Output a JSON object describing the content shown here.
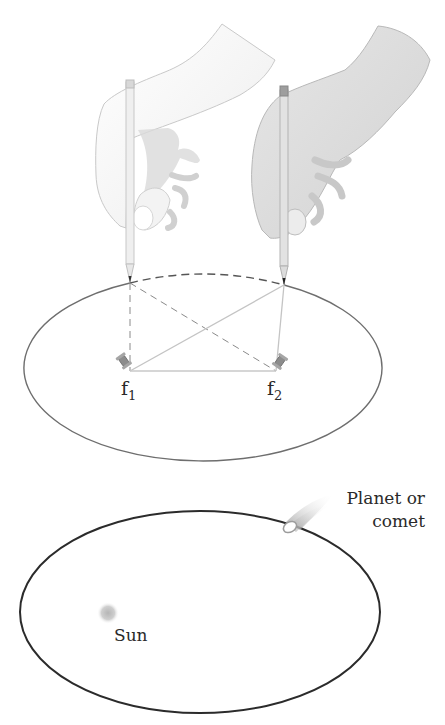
{
  "diagram": {
    "top_panel": {
      "description": "Drawing an ellipse with a pencil and string looped around two pins",
      "foci": [
        {
          "id": "f1",
          "label": "f",
          "subscript": "1"
        },
        {
          "id": "f2",
          "label": "f",
          "subscript": "2"
        }
      ],
      "hands": [
        "left-hand-pencil",
        "right-hand-pencil"
      ]
    },
    "bottom_panel": {
      "description": "Elliptical orbit with the Sun at one focus",
      "sun_label": "Sun",
      "body_label_line1": "Planet or",
      "body_label_line2": "comet"
    },
    "colors": {
      "ellipse_top": "#6e6e6e",
      "ellipse_bottom": "#2b2b2b",
      "string_dashed": "#8a8a8a",
      "string_solid": "#c4c4c4",
      "hand_light": "#f2f2f2",
      "hand_dark": "#d9d9d9",
      "sun": "#bdbdbd"
    }
  }
}
